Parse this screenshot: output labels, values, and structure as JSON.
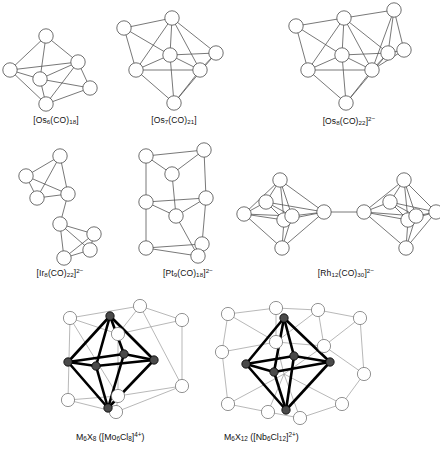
{
  "figure": {
    "background": "#ffffff",
    "ink": "#555555",
    "bold_ink": "#000000",
    "ligand_ink": "#9a9a9a"
  },
  "clusters": [
    {
      "id": "os6",
      "label_html": "[Os<sub>6</sub>(CO)<sub>18</sub>]",
      "label_plain": "[Os6(CO)18]",
      "metal": "Os",
      "metal_count": 6,
      "geometry": "capped trigonal bipyramid / bicapped tetrahedron",
      "vertices": 6,
      "row": 1,
      "column": 1
    },
    {
      "id": "os7",
      "label_html": "[Os<sub>7</sub>(CO)<sub>21</sub>]",
      "label_plain": "[Os7(CO)21]",
      "metal": "Os",
      "metal_count": 7,
      "geometry": "capped octahedron",
      "vertices": 7,
      "row": 1,
      "column": 2
    },
    {
      "id": "os8",
      "label_html": "[Os<sub>8</sub>(CO)<sub>22</sub>]<sup>2&minus;</sup>",
      "label_plain": "[Os8(CO)22]2-",
      "metal": "Os",
      "metal_count": 8,
      "geometry": "bicapped octahedron",
      "vertices": 8,
      "charge": "2-",
      "row": 1,
      "column": 3
    },
    {
      "id": "ir8",
      "label_html": "[Ir<sub>8</sub>(CO)<sub>22</sub>]<sup>2&minus;</sup>",
      "label_plain": "[Ir8(CO)22]2-",
      "metal": "Ir",
      "metal_count": 8,
      "geometry": "two tetrahedra linked by a single metal-metal bond",
      "vertices": 8,
      "charge": "2-",
      "row": 2,
      "column": 1
    },
    {
      "id": "pt9",
      "label_html": "[Pt<sub>9</sub>(CO)<sub>18</sub>]<sup>2&minus;</sup>",
      "label_plain": "[Pt9(CO)18]2-",
      "metal": "Pt",
      "metal_count": 9,
      "geometry": "stack of three eclipsed Pt3 triangles",
      "vertices": 9,
      "charge": "2-",
      "row": 2,
      "column": 2
    },
    {
      "id": "rh12",
      "label_html": "[Rh<sub>12</sub>(CO)<sub>30</sub>]<sup>2&minus;</sup>",
      "label_plain": "[Rh12(CO)30]2-",
      "metal": "Rh",
      "metal_count": 12,
      "geometry": "two octahedra joined by a single metal-metal bond",
      "vertices": 12,
      "charge": "2-",
      "row": 2,
      "column": 3
    },
    {
      "id": "m6x8",
      "label_html": "M<sub>6</sub>X<sub>8</sub> ([Mo<sub>6</sub>Cl<sub>8</sub>]<sup>4+</sup>)",
      "label_plain": "M6X8 ([Mo6Cl8]4+)",
      "metal": "Mo",
      "metal_count": 6,
      "halide": "Cl",
      "halide_count": 8,
      "geometry": "octahedral M6 core with 8 face-capping X ligands",
      "charge": "4+",
      "row": 3,
      "column": 1
    },
    {
      "id": "m6x12",
      "label_html": "M<sub>6</sub>X<sub>12</sub> ([Nb<sub>6</sub>Cl<sub>12</sub>]<sup>2+</sup>)",
      "label_plain": "M6X12 ([Nb6Cl12]2+)",
      "metal": "Nb",
      "metal_count": 6,
      "halide": "Cl",
      "halide_count": 12,
      "geometry": "octahedral M6 core with 12 edge-bridging X ligands",
      "charge": "2+",
      "row": 3,
      "column": 2
    }
  ]
}
